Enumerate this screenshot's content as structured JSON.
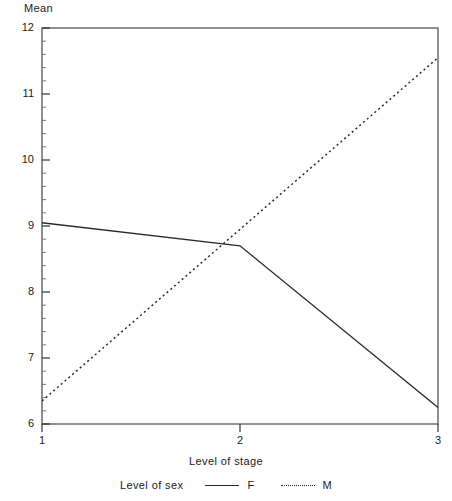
{
  "chart_data": {
    "type": "line",
    "title": "",
    "xlabel": "Level of stage",
    "ylabel": "Mean",
    "x": [
      1,
      2,
      3
    ],
    "xtick_labels": [
      "1",
      "2",
      "3"
    ],
    "ytick_labels": [
      "6",
      "7",
      "8",
      "9",
      "10",
      "11",
      "12"
    ],
    "xlim": [
      1,
      3
    ],
    "ylim": [
      6,
      12
    ],
    "y_major_step": 1,
    "y_minor_step": 0.2,
    "grid": false,
    "legend_title": "Level of sex",
    "legend_position": "bottom",
    "series": [
      {
        "name": "F",
        "style": "solid",
        "color": "#2a2a2a",
        "values": [
          9.05,
          8.7,
          6.25
        ]
      },
      {
        "name": "M",
        "style": "dotted",
        "color": "#2a2a2a",
        "values": [
          6.35,
          8.95,
          11.55
        ]
      }
    ]
  },
  "labels": {
    "ylabel": "Mean",
    "xlabel": "Level of stage",
    "legend_title": "Level of sex",
    "legend_f": "F",
    "legend_m": "M",
    "y6": "6",
    "y7": "7",
    "y8": "8",
    "y9": "9",
    "y10": "10",
    "y11": "11",
    "y12": "12",
    "x1": "1",
    "x2": "2",
    "x3": "3"
  }
}
